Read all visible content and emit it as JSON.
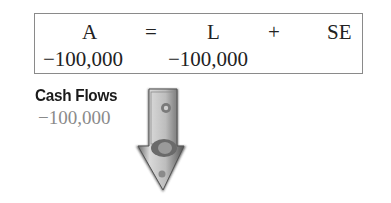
{
  "equation": {
    "headers": {
      "assets": "A",
      "equals": "=",
      "liabilities": "L",
      "plus": "+",
      "equity": "SE"
    },
    "values": {
      "assets": "−100,000",
      "liabilities": "−100,000",
      "equity": ""
    }
  },
  "cash_flows": {
    "title": "Cash Flows",
    "value": "−100,000",
    "icon": "money-down-arrow-icon"
  }
}
